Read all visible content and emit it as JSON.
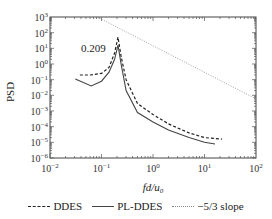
{
  "chart_data": {
    "type": "line",
    "title": "",
    "xlabel": "fd/u0",
    "ylabel": "PSD",
    "xscale": "log",
    "yscale": "log",
    "xlim": [
      0.01,
      100
    ],
    "ylim": [
      1e-06,
      1000
    ],
    "x_ticks": [
      "10^-2",
      "10^-1",
      "10^0",
      "10^1",
      "10^2"
    ],
    "y_ticks": [
      "10^-6",
      "10^-5",
      "10^-4",
      "10^-3",
      "10^-2",
      "10^-1",
      "10^0",
      "10^1",
      "10^2",
      "10^3"
    ],
    "grid": false,
    "legend_position": "bottom",
    "annotations": [
      {
        "text": "0.209",
        "x": 0.209,
        "note": "peak frequency"
      }
    ],
    "series": [
      {
        "name": "DDES",
        "style": "dashed",
        "x": [
          0.038,
          0.06,
          0.1,
          0.14,
          0.18,
          0.209,
          0.24,
          0.3,
          0.5,
          1.0,
          2.0,
          5.0,
          10.0,
          22.0
        ],
        "y": [
          0.2,
          0.2,
          0.25,
          0.6,
          5.0,
          52,
          3.0,
          0.1,
          0.003,
          0.0006,
          0.00015,
          4e-05,
          2e-05,
          1.6e-05
        ]
      },
      {
        "name": "PL-DDES",
        "style": "solid",
        "x": [
          0.031,
          0.063,
          0.1,
          0.14,
          0.18,
          0.209,
          0.24,
          0.3,
          0.5,
          1.0,
          2.0,
          5.0,
          10.0,
          16.0
        ],
        "y": [
          0.11,
          0.04,
          0.08,
          0.3,
          2.0,
          16,
          1.0,
          0.02,
          0.0008,
          0.0002,
          6e-05,
          2e-05,
          1e-05,
          7.8e-06
        ]
      },
      {
        "name": "-5/3 slope",
        "style": "dotted",
        "x": [
          0.083,
          100
        ],
        "y": [
          1000,
          0.0059
        ]
      }
    ]
  },
  "axes": {
    "ylabel": "PSD",
    "xlabel_main": "fd/u",
    "xlabel_sub": "0",
    "x_ticks": [
      {
        "base": "10",
        "exp": "-2"
      },
      {
        "base": "10",
        "exp": "-1"
      },
      {
        "base": "10",
        "exp": "0"
      },
      {
        "base": "10",
        "exp": "1"
      },
      {
        "base": "10",
        "exp": "2"
      }
    ],
    "y_ticks": [
      {
        "base": "10",
        "exp": "3"
      },
      {
        "base": "10",
        "exp": "2"
      },
      {
        "base": "10",
        "exp": "1"
      },
      {
        "base": "10",
        "exp": "0"
      },
      {
        "base": "10",
        "exp": "-1"
      },
      {
        "base": "10",
        "exp": "-2"
      },
      {
        "base": "10",
        "exp": "-3"
      },
      {
        "base": "10",
        "exp": "-4"
      },
      {
        "base": "10",
        "exp": "-5"
      },
      {
        "base": "10",
        "exp": "-6"
      }
    ]
  },
  "annotation": {
    "peak_label": "0.209"
  },
  "legend": {
    "items": [
      {
        "label": "DDES"
      },
      {
        "label": "PL-DDES"
      },
      {
        "label": "−5/3 slope"
      }
    ]
  },
  "colors": {
    "line": "#222222",
    "slope": "#888888"
  }
}
